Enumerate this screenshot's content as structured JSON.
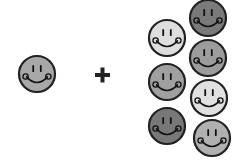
{
  "diagram": {
    "type": "addition-of-smiley-faces",
    "operator": "+",
    "left_group": {
      "count": 1,
      "faces": [
        {
          "cx": 37,
          "cy": 74,
          "r": 19,
          "fill": "#a8a8a8"
        }
      ]
    },
    "right_group": {
      "count": 7,
      "faces": [
        {
          "cx": 167,
          "cy": 38,
          "r": 19,
          "fill": "#dedede"
        },
        {
          "cx": 208,
          "cy": 18,
          "r": 19,
          "fill": "#7a7a7a"
        },
        {
          "cx": 208,
          "cy": 58,
          "r": 19,
          "fill": "#9c9c9c"
        },
        {
          "cx": 167,
          "cy": 82,
          "r": 19,
          "fill": "#a0a0a0"
        },
        {
          "cx": 209,
          "cy": 98,
          "r": 19,
          "fill": "#e0e0e0"
        },
        {
          "cx": 167,
          "cy": 126,
          "r": 19,
          "fill": "#787878"
        },
        {
          "cx": 212,
          "cy": 138,
          "r": 19,
          "fill": "#b0b0b0"
        }
      ]
    },
    "colors": {
      "outline": "#222222",
      "features": "#111111",
      "background": "#ffffff"
    }
  }
}
